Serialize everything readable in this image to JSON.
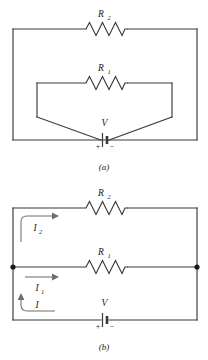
{
  "figure": {
    "panels": [
      {
        "caption": "(a)",
        "description": "Series-parallel resistor circuit with battery",
        "components": [
          {
            "type": "resistor",
            "label": "R",
            "subscript": "2",
            "position": "top-branch"
          },
          {
            "type": "resistor",
            "label": "R",
            "subscript": "1",
            "position": "inner-branch"
          },
          {
            "type": "battery",
            "label": "V",
            "plus_sign": "+",
            "minus_sign": "−",
            "position": "bottom-center"
          }
        ]
      },
      {
        "caption": "(b)",
        "description": "Redrawn parallel circuit with labelled branch currents",
        "components": [
          {
            "type": "resistor",
            "label": "R",
            "subscript": "2",
            "position": "top-branch"
          },
          {
            "type": "resistor",
            "label": "R",
            "subscript": "1",
            "position": "middle-branch"
          },
          {
            "type": "battery",
            "label": "V",
            "plus_sign": "+",
            "minus_sign": "−",
            "position": "bottom-center"
          }
        ],
        "currents": [
          {
            "label": "I",
            "subscript": "2",
            "branch": "top",
            "direction": "right"
          },
          {
            "label": "I",
            "subscript": "1",
            "branch": "middle",
            "direction": "right"
          },
          {
            "label": "I",
            "subscript": "",
            "branch": "bottom",
            "direction": "up-right"
          }
        ],
        "junction_dots": 2
      }
    ],
    "colors": {
      "wire": "#3a3a3a",
      "arrow": "#6e6e6e",
      "text": "#1a1a1a",
      "background": "#ffffff"
    }
  },
  "panel_a": {
    "r2_label": "R",
    "r2_sub": "2",
    "r1_label": "R",
    "r1_sub": "1",
    "v_label": "V",
    "plus": "+",
    "minus": "−",
    "caption": "(a)"
  },
  "panel_b": {
    "r2_label": "R",
    "r2_sub": "2",
    "r1_label": "R",
    "r1_sub": "1",
    "v_label": "V",
    "plus": "+",
    "minus": "−",
    "i2_label": "I",
    "i2_sub": "2",
    "i1_label": "I",
    "i1_sub": "1",
    "i_label": "I",
    "caption": "(b)"
  }
}
